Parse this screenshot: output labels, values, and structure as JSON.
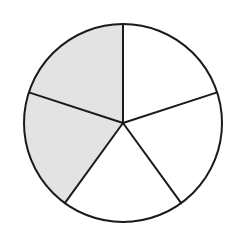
{
  "diagram": {
    "type": "fraction-circle",
    "total_parts": 5,
    "shaded_parts": 2,
    "fraction_shaded": "2/5",
    "center": [
      123,
      123
    ],
    "radius": 99,
    "start_angle_deg": 0,
    "shaded_indices": [
      3,
      4
    ],
    "colors": {
      "shaded": "#e3e3e3",
      "unshaded": "#ffffff",
      "stroke": "#1a1a1a",
      "background": "#ffffff"
    },
    "stroke_width": 2
  },
  "chart_data": {
    "type": "pie",
    "title": "",
    "categories": [
      "Part 1",
      "Part 2",
      "Part 3",
      "Part 4",
      "Part 5"
    ],
    "values": [
      1,
      1,
      1,
      1,
      1
    ],
    "shaded": [
      false,
      false,
      false,
      true,
      true
    ],
    "legend": "none"
  }
}
